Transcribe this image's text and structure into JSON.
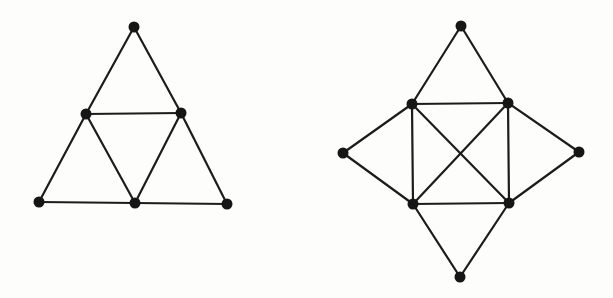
{
  "canvas": {
    "width": 613,
    "height": 298,
    "background": "#fdfdfc"
  },
  "figures": [
    {
      "name": "triangulated-triangle-graph",
      "node_color": "#161616",
      "edge_color": "#1c1c1c",
      "node_radius": 5.5,
      "edge_width": 2.2,
      "nodes": [
        {
          "id": "apex",
          "x": 134,
          "y": 27
        },
        {
          "id": "mid-left",
          "x": 86,
          "y": 114
        },
        {
          "id": "mid-right",
          "x": 181,
          "y": 113
        },
        {
          "id": "bottom-left",
          "x": 39,
          "y": 202
        },
        {
          "id": "bottom-mid",
          "x": 135,
          "y": 203
        },
        {
          "id": "bottom-right",
          "x": 227,
          "y": 204
        }
      ],
      "edges": [
        [
          0,
          1
        ],
        [
          0,
          2
        ],
        [
          1,
          2
        ],
        [
          1,
          3
        ],
        [
          1,
          4
        ],
        [
          2,
          4
        ],
        [
          2,
          5
        ],
        [
          3,
          4
        ],
        [
          4,
          5
        ]
      ]
    },
    {
      "name": "square-k4-with-spikes-graph",
      "node_color": "#161616",
      "edge_color": "#1c1c1c",
      "node_radius": 5.5,
      "edge_width": 2.2,
      "nodes": [
        {
          "id": "top-apex",
          "x": 461,
          "y": 26
        },
        {
          "id": "inner-top-left",
          "x": 412,
          "y": 104
        },
        {
          "id": "inner-top-right",
          "x": 508,
          "y": 103
        },
        {
          "id": "outer-left",
          "x": 343,
          "y": 153
        },
        {
          "id": "outer-right",
          "x": 579,
          "y": 152
        },
        {
          "id": "inner-bottom-left",
          "x": 413,
          "y": 204
        },
        {
          "id": "inner-bottom-right",
          "x": 509,
          "y": 203
        },
        {
          "id": "bottom-apex",
          "x": 460,
          "y": 277
        }
      ],
      "edges": [
        [
          0,
          1
        ],
        [
          0,
          2
        ],
        [
          3,
          1
        ],
        [
          3,
          5
        ],
        [
          4,
          2
        ],
        [
          4,
          6
        ],
        [
          7,
          5
        ],
        [
          7,
          6
        ],
        [
          1,
          2
        ],
        [
          2,
          6
        ],
        [
          6,
          5
        ],
        [
          5,
          1
        ],
        [
          1,
          6
        ],
        [
          2,
          5
        ]
      ]
    }
  ]
}
